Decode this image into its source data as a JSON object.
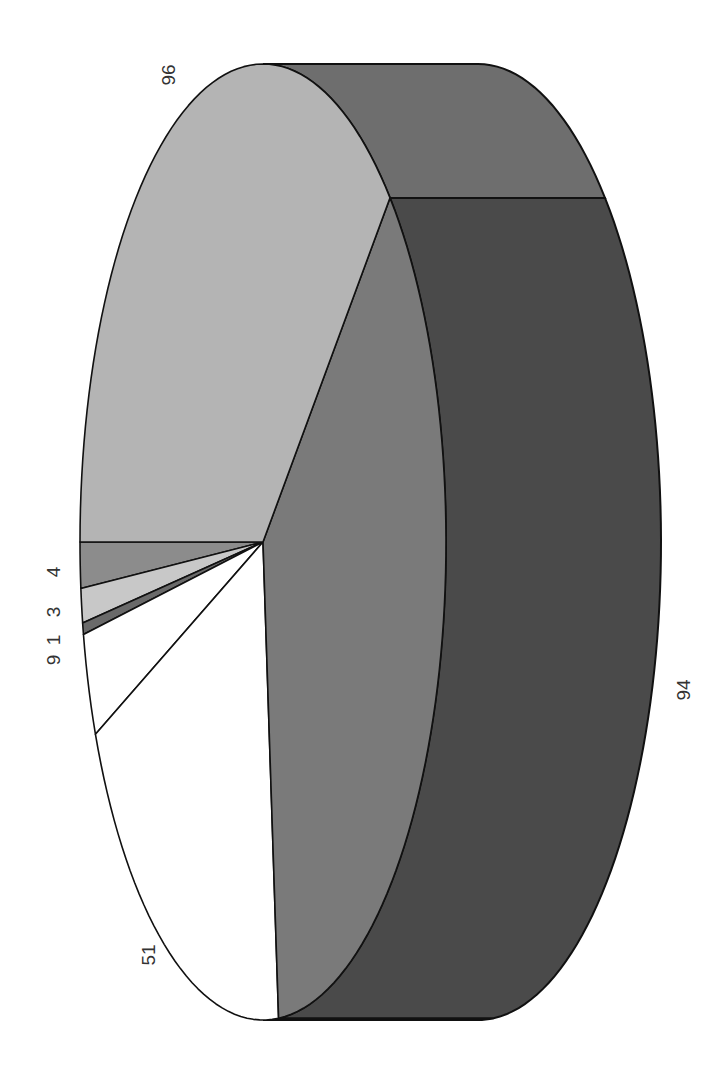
{
  "chart_data": {
    "type": "pie",
    "style": "3d-pie, rotated 90 degrees",
    "title": "",
    "categories": [
      "96",
      "94",
      "51",
      "9",
      "1",
      "3",
      "4"
    ],
    "values": [
      96,
      94,
      51,
      9,
      1,
      3,
      4
    ],
    "labels": [
      "96",
      "94",
      "51",
      "9",
      "1",
      "3",
      "4"
    ],
    "colors": [
      "#b4b4b4",
      "#7a7a7a",
      "#ffffff",
      "#ffffff",
      "#6a6a6a",
      "#c8c8c8",
      "#8c8c8c"
    ],
    "side_colors": {
      "96": "#6e6e6e",
      "94": "#4a4a4a",
      "51": "#d8d8d8"
    },
    "legend": "none",
    "grid": false
  }
}
